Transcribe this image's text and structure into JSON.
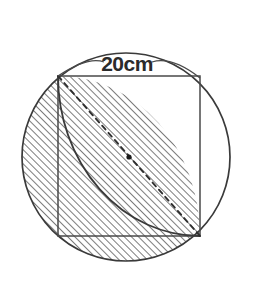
{
  "figure": {
    "dimension_label": "20cm",
    "shapes": {
      "circle": {
        "name": "outer-circle",
        "center_x": 126,
        "center_y": 157,
        "radius": 104,
        "stroke": "#3a3a3a",
        "fill": "#ffffff"
      },
      "square": {
        "name": "inscribed-square",
        "side_label": "20cm",
        "top_left_x": 58,
        "top_left_y": 76,
        "top_right_x": 200,
        "top_right_y": 76,
        "bottom_right_x": 200,
        "bottom_right_y": 236,
        "bottom_left_x": 58,
        "bottom_left_y": 236,
        "stroke": "#4a4a4a"
      },
      "quarter_arc": {
        "name": "quarter-circle-arc",
        "center_x": 200,
        "center_y": 76,
        "start_x": 58,
        "start_y": 76,
        "end_x": 200,
        "end_y": 236,
        "stroke": "#3a3a3a"
      },
      "diagonal": {
        "name": "dashed-diagonal",
        "from_x": 58,
        "from_y": 76,
        "to_x": 200,
        "to_y": 236,
        "style": "dashed",
        "stroke": "#2f2f2f"
      },
      "center_dot": {
        "name": "circle-center-dot",
        "x": 129,
        "y": 157,
        "radius": 2.6,
        "fill": "#1a1a1a"
      }
    },
    "hatching": {
      "angle_degrees": 45,
      "spacing_px": 5,
      "stroke": "#3d3d3d",
      "regions": [
        "square-outside-quarter-circle",
        "circle-segment-left-of-square",
        "circle-segment-below-square"
      ]
    },
    "dimension_line": {
      "name": "dimension-leader",
      "label": "20cm",
      "label_x": 127,
      "label_y": 71,
      "stroke": "#4a4a4a"
    },
    "colors": {
      "ink": "#3a3a3a",
      "hatch": "#3d3d3d",
      "background": "#ffffff",
      "white_fill": "#ffffff"
    }
  }
}
